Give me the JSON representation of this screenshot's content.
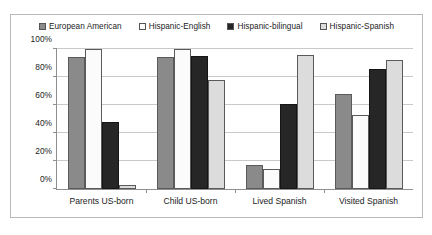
{
  "chart_data": {
    "type": "bar",
    "title": "",
    "xlabel": "",
    "ylabel": "",
    "ylim": [
      0,
      100
    ],
    "grid": true,
    "legend_position": "top",
    "categories": [
      "Parents US-born",
      "Child US-born",
      "Lived Spanish",
      "Visited Spanish"
    ],
    "ytick_labels": [
      "0%",
      "20%",
      "40%",
      "60%",
      "80%",
      "100%"
    ],
    "ytick_values": [
      0,
      20,
      40,
      60,
      80,
      100
    ],
    "series": [
      {
        "name": "European American",
        "color": "#8a8a8a",
        "values": [
          94,
          94,
          17,
          68
        ]
      },
      {
        "name": "Hispanic-English",
        "color": "#fbfbfb",
        "values": [
          100,
          100,
          14,
          53
        ]
      },
      {
        "name": "Hispanic-bilingual",
        "color": "#262626",
        "values": [
          48,
          95,
          61,
          86
        ]
      },
      {
        "name": "Hispanic-Spanish",
        "color": "#dcdcdc",
        "values": [
          3,
          78,
          96,
          92
        ]
      }
    ]
  }
}
